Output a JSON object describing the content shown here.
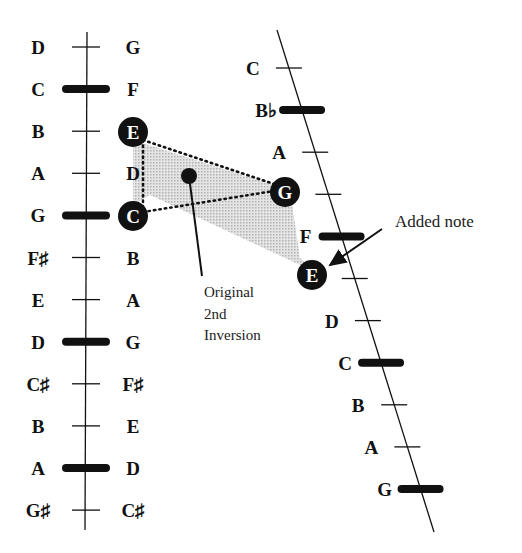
{
  "left_axis": {
    "rows": [
      {
        "left": "D",
        "right": "G",
        "bold_tick": false
      },
      {
        "left": "C",
        "right": "F",
        "bold_tick": true
      },
      {
        "left": "B",
        "right": "E",
        "bold_tick": false,
        "right_circled": true
      },
      {
        "left": "A",
        "right": "D",
        "bold_tick": false
      },
      {
        "left": "G",
        "right": "C",
        "bold_tick": true,
        "right_circled": true
      },
      {
        "left": "F♯",
        "right": "B",
        "bold_tick": false
      },
      {
        "left": "E",
        "right": "A",
        "bold_tick": false
      },
      {
        "left": "D",
        "right": "G",
        "bold_tick": true
      },
      {
        "left": "C♯",
        "right": "F♯",
        "bold_tick": false
      },
      {
        "left": "B",
        "right": "E",
        "bold_tick": false
      },
      {
        "left": "A",
        "right": "D",
        "bold_tick": true
      },
      {
        "left": "G♯",
        "right": "C♯",
        "bold_tick": false
      }
    ]
  },
  "right_axis": {
    "rows": [
      {
        "label": "C",
        "bold_tick": false
      },
      {
        "label": "B♭",
        "bold_tick": true
      },
      {
        "label": "A",
        "bold_tick": false
      },
      {
        "label": "G",
        "bold_tick": false,
        "circled": true
      },
      {
        "label": "F",
        "bold_tick": true
      },
      {
        "label": "E",
        "bold_tick": false,
        "circled": true
      },
      {
        "label": "D",
        "bold_tick": false
      },
      {
        "label": "C",
        "bold_tick": true
      },
      {
        "label": "B",
        "bold_tick": false
      },
      {
        "label": "A",
        "bold_tick": false
      },
      {
        "label": "G",
        "bold_tick": true
      }
    ]
  },
  "annotations": {
    "original_line1": "Original",
    "original_line2": "2nd",
    "original_line3": "Inversion",
    "added_note": "Added note"
  },
  "colors": {
    "ink": "#111111",
    "shade": "#c8c8c8"
  }
}
